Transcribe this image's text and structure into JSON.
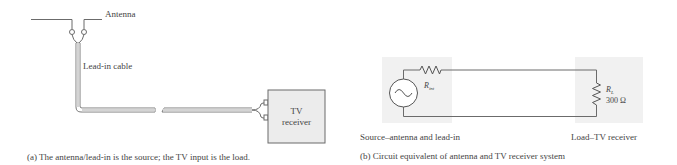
{
  "panel_a": {
    "antenna_label": "Antenna",
    "cable_label": "Lead-in cable",
    "tv_label_line1": "TV",
    "tv_label_line2": "receiver",
    "caption": "(a) The antenna/lead-in is the source; the TV input is the load."
  },
  "panel_b": {
    "r_int_label_main": "R",
    "r_int_label_sub": "int",
    "r_load_label_main": "R",
    "r_load_label_sub": "L",
    "r_load_value": "300 Ω",
    "source_label": "Source–antenna and lead-in",
    "load_label": "Load–TV receiver",
    "caption": "(b) Circuit equivalent of antenna and TV receiver system"
  },
  "colors": {
    "line": "#6b6b6b",
    "box_fill": "#ececec",
    "shade": "#f1f1f1"
  }
}
